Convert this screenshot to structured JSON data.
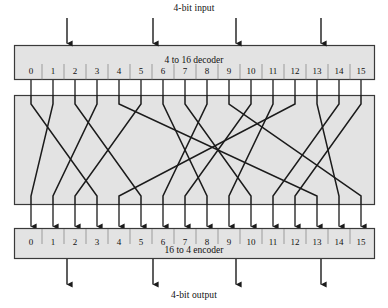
{
  "captions": {
    "input": "4-bit input",
    "output": "4-bit output"
  },
  "decoder": {
    "label": "4 to 16 decoder",
    "ports": [
      "0",
      "1",
      "2",
      "3",
      "4",
      "5",
      "6",
      "7",
      "8",
      "9",
      "10",
      "11",
      "12",
      "13",
      "14",
      "15"
    ]
  },
  "encoder": {
    "label": "16 to 4 encoder",
    "ports": [
      "0",
      "1",
      "2",
      "3",
      "4",
      "5",
      "6",
      "7",
      "8",
      "9",
      "10",
      "11",
      "12",
      "13",
      "14",
      "15"
    ]
  },
  "colors": {
    "box_fill": "#e3e3e3",
    "box_stroke": "#3a3a3a",
    "wire": "#1b1b1b",
    "text": "#111111",
    "page_bg": "#ffffff"
  },
  "geometry": {
    "decoder_box": {
      "x": 14,
      "y": 45,
      "w": 361,
      "h": 35
    },
    "crossbar_box": {
      "x": 14,
      "y": 95,
      "w": 361,
      "h": 110
    },
    "encoder_box": {
      "x": 14,
      "y": 228,
      "w": 361,
      "h": 31
    },
    "port_x": [
      31,
      53,
      75,
      97,
      119,
      141,
      163,
      185,
      207,
      229,
      251,
      273,
      295,
      317,
      339,
      361
    ],
    "port_label_y_decoder": 72,
    "port_label_y_encoder": 238,
    "input_arrow_x": [
      67,
      153,
      236,
      321
    ],
    "output_arrow_x": [
      67,
      153,
      236,
      321
    ],
    "input_arrow_top": 18,
    "input_arrow_bottom": 45,
    "output_arrow_top": 259,
    "output_arrow_bottom": 286
  },
  "chart_data": {
    "type": "diagram",
    "permutation_note": "Decoder output i is wired to encoder input perm[i].",
    "perm": [
      3,
      0,
      5,
      1,
      13,
      2,
      8,
      10,
      6,
      15,
      7,
      9,
      4,
      14,
      11,
      12
    ]
  }
}
